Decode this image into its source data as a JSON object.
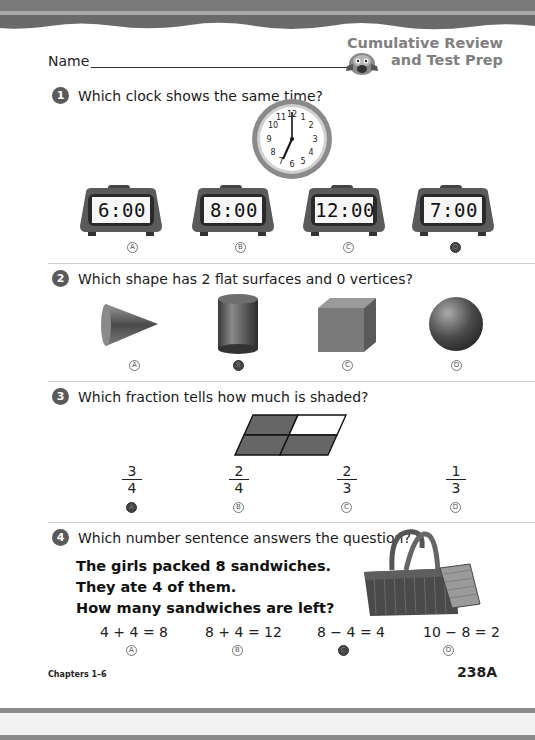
{
  "header": {
    "name_label": "Name",
    "brand_line1": "Cumulative Review",
    "brand_line2": "and Test Prep"
  },
  "questions": [
    {
      "number": "1",
      "prompt": "Which clock shows the same time?",
      "analog_clock": {
        "hour": 7,
        "minute": 0,
        "numerals": [
          "12",
          "1",
          "2",
          "3",
          "4",
          "5",
          "6",
          "7",
          "8",
          "9",
          "10",
          "11"
        ]
      },
      "choices": [
        {
          "letter": "A",
          "value": "6:00",
          "selected": false
        },
        {
          "letter": "B",
          "value": "8:00",
          "selected": false
        },
        {
          "letter": "C",
          "value": "12:00",
          "selected": false
        },
        {
          "letter": "D",
          "value": "7:00",
          "selected": true
        }
      ]
    },
    {
      "number": "2",
      "prompt": "Which shape has 2 flat surfaces and 0 vertices?",
      "choices": [
        {
          "letter": "A",
          "value": "cone",
          "selected": false
        },
        {
          "letter": "B",
          "value": "cylinder",
          "selected": true
        },
        {
          "letter": "C",
          "value": "cube",
          "selected": false
        },
        {
          "letter": "D",
          "value": "sphere",
          "selected": false
        }
      ]
    },
    {
      "number": "3",
      "prompt": "Which fraction tells how much is shaded?",
      "figure": {
        "parts": 4,
        "shaded": 3
      },
      "choices": [
        {
          "letter": "A",
          "numerator": "3",
          "denominator": "4",
          "selected": true
        },
        {
          "letter": "B",
          "numerator": "2",
          "denominator": "4",
          "selected": false
        },
        {
          "letter": "C",
          "numerator": "2",
          "denominator": "3",
          "selected": false
        },
        {
          "letter": "D",
          "numerator": "1",
          "denominator": "3",
          "selected": false
        }
      ]
    },
    {
      "number": "4",
      "prompt": "Which number sentence answers the question?",
      "story": [
        "The girls packed 8 sandwiches.",
        "They ate 4 of them.",
        "How many sandwiches are left?"
      ],
      "choices": [
        {
          "letter": "A",
          "value": "4 + 4 = 8",
          "selected": false
        },
        {
          "letter": "B",
          "value": "8 + 4 = 12",
          "selected": false
        },
        {
          "letter": "C",
          "value": "8 − 4 = 4",
          "selected": true
        },
        {
          "letter": "D",
          "value": "10 − 8 = 2",
          "selected": false
        }
      ]
    }
  ],
  "footer": {
    "chapters": "Chapters 1–6",
    "page_number": "238A"
  },
  "colors": {
    "band": "#6e6e6e",
    "bubble_filled": "#444444",
    "brand_text": "#808080",
    "shaded": "#666666"
  }
}
